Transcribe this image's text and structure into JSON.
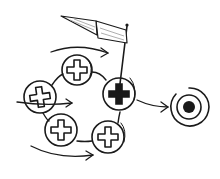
{
  "diagram": {
    "title": "",
    "description_visible_text": [],
    "colors": {
      "ink": "#1a1a1a",
      "background": "#ffffff",
      "flag_shade": "#9a9a9a"
    },
    "nodes": [
      {
        "id": "cross-1",
        "icon": "cross-icon",
        "filled": false,
        "cx": 77,
        "cy": 70,
        "r": 15
      },
      {
        "id": "cross-2",
        "icon": "cross-icon",
        "filled": false,
        "cx": 40,
        "cy": 97,
        "r": 16
      },
      {
        "id": "cross-3",
        "icon": "cross-icon",
        "filled": false,
        "cx": 61,
        "cy": 130,
        "r": 16
      },
      {
        "id": "cross-4",
        "icon": "cross-icon",
        "filled": false,
        "cx": 108,
        "cy": 137,
        "r": 16
      },
      {
        "id": "cross-5",
        "icon": "cross-icon",
        "filled": true,
        "cx": 119,
        "cy": 94,
        "r": 16,
        "has_flag": true
      }
    ],
    "target": {
      "icon": "target-icon",
      "cx": 189,
      "cy": 107
    },
    "flag": {
      "icon": "flag-icon"
    },
    "arrows": [
      "flow-arrow-top",
      "flow-arrow-middle",
      "flow-arrow-bottom",
      "exit-arrow-to-target"
    ]
  }
}
